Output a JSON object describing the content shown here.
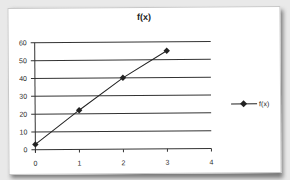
{
  "chart_data": {
    "type": "line",
    "title": "f(x)",
    "xlabel": "",
    "ylabel": "",
    "x": [
      0,
      1,
      2,
      3
    ],
    "series": [
      {
        "name": "f(x)",
        "values": [
          3,
          22,
          40,
          55
        ],
        "color": "#222222",
        "marker": "diamond"
      }
    ],
    "xlim": [
      0,
      4
    ],
    "ylim": [
      0,
      60
    ],
    "x_ticks": [
      "0",
      "1",
      "2",
      "3",
      "4"
    ],
    "y_ticks": [
      "0",
      "10",
      "20",
      "30",
      "40",
      "50",
      "60"
    ],
    "grid": {
      "horizontal": true,
      "vertical": false
    },
    "legend_position": "right"
  },
  "legend": {
    "label": "f(x)"
  }
}
